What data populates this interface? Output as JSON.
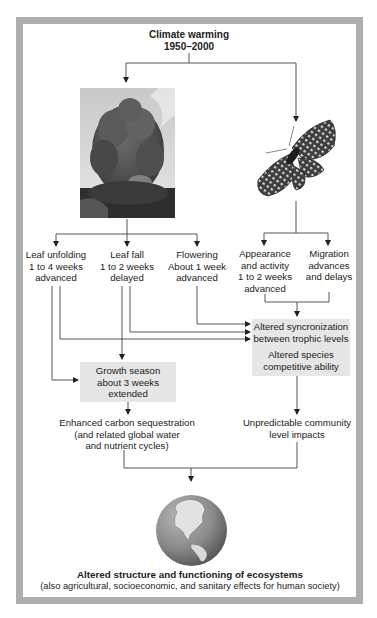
{
  "title": {
    "line1": "Climate warming",
    "line2": "1950–2000"
  },
  "images": {
    "tree": "tree-photo",
    "butterfly": "butterfly-photo",
    "globe": "globe-americas"
  },
  "plant_effects": [
    {
      "line1": "Leaf unfolding",
      "line2": "1 to 4 weeks",
      "line3": "advanced"
    },
    {
      "line1": "Leaf fall",
      "line2": "1 to 2 weeks",
      "line3": "delayed"
    },
    {
      "line1": "Flowering",
      "line2": "About 1 week",
      "line3": "advanced"
    }
  ],
  "animal_effects": [
    {
      "line1": "Appearance",
      "line2": "and activity",
      "line3": "1 to 2 weeks",
      "line4": "advanced"
    },
    {
      "line1": "Migration",
      "line2": "advances",
      "line3": "and delays"
    }
  ],
  "growth_box": {
    "line1": "Growth season",
    "line2": "about 3 weeks",
    "line3": "extended"
  },
  "altered_box": {
    "line1": "Altered syncronization",
    "line2": "between trophic levels",
    "line3": "Altered species",
    "line4": "competitive ability"
  },
  "carbon": {
    "line1": "Enhanced carbon sequestration",
    "line2": "(and related global water",
    "line3": "and nutrient cycles)"
  },
  "community": {
    "line1": "Unpredictable community",
    "line2": "level impacts"
  },
  "conclusion": {
    "title": "Altered structure and functioning of ecosystems",
    "subtitle": "(also agricultural, socioeconomic, and sanitary effects for human society)"
  },
  "colors": {
    "frame": "#aeaeae",
    "box_fill": "#e6e6e6",
    "line": "#333333"
  }
}
